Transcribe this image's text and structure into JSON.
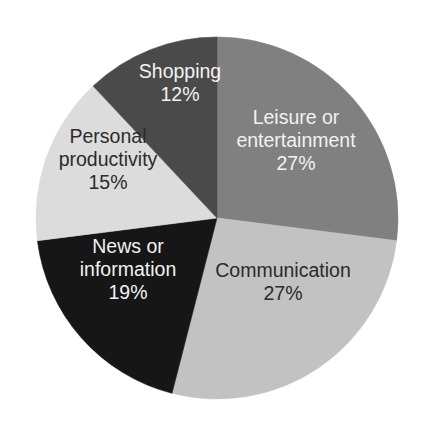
{
  "chart_data": {
    "type": "pie",
    "title": "",
    "subtitle": "",
    "xlabel": "",
    "ylabel": "",
    "legend": "none",
    "grid": false,
    "units": "percent",
    "start_angle_deg": 0,
    "direction": "clockwise",
    "background_color": "#ffffff",
    "categories": [
      "Leisure or entertainment",
      "Communication",
      "News or information",
      "Personal productivity",
      "Shopping"
    ],
    "values": [
      27,
      27,
      19,
      15,
      12
    ],
    "slices": [
      {
        "label_line1": "Leisure or",
        "label_line2": "entertainment",
        "label_full": "Leisure or entertainment",
        "value": 27,
        "value_text": "27%",
        "color": "#808080",
        "text_color": "#f2f2f2",
        "label_x": 296,
        "label_y": 142,
        "line_height": 23,
        "lines": 2
      },
      {
        "label_line1": "Communication",
        "label_line2": "",
        "label_full": "Communication",
        "value": 27,
        "value_text": "27%",
        "color": "#c2c2c2",
        "text_color": "#2b2b2b",
        "label_x": 283,
        "label_y": 283,
        "line_height": 23,
        "lines": 1
      },
      {
        "label_line1": "News or",
        "label_line2": "information",
        "label_full": "News or information",
        "value": 19,
        "value_text": "19%",
        "color": "#161616",
        "text_color": "#f2f2f2",
        "label_x": 128,
        "label_y": 271,
        "line_height": 23,
        "lines": 2
      },
      {
        "label_line1": "Personal",
        "label_line2": "productivity",
        "label_full": "Personal productivity",
        "value": 15,
        "value_text": "15%",
        "color": "#dcdcdc",
        "text_color": "#2b2b2b",
        "label_x": 108,
        "label_y": 161,
        "line_height": 23,
        "lines": 2
      },
      {
        "label_line1": "Shopping",
        "label_line2": "",
        "label_full": "Shopping",
        "value": 12,
        "value_text": "12%",
        "color": "#4a4a4a",
        "text_color": "#f2f2f2",
        "label_x": 180,
        "label_y": 84,
        "line_height": 23,
        "lines": 1
      }
    ],
    "geometry": {
      "center_x": 217,
      "center_y": 218,
      "radius": 181
    }
  }
}
